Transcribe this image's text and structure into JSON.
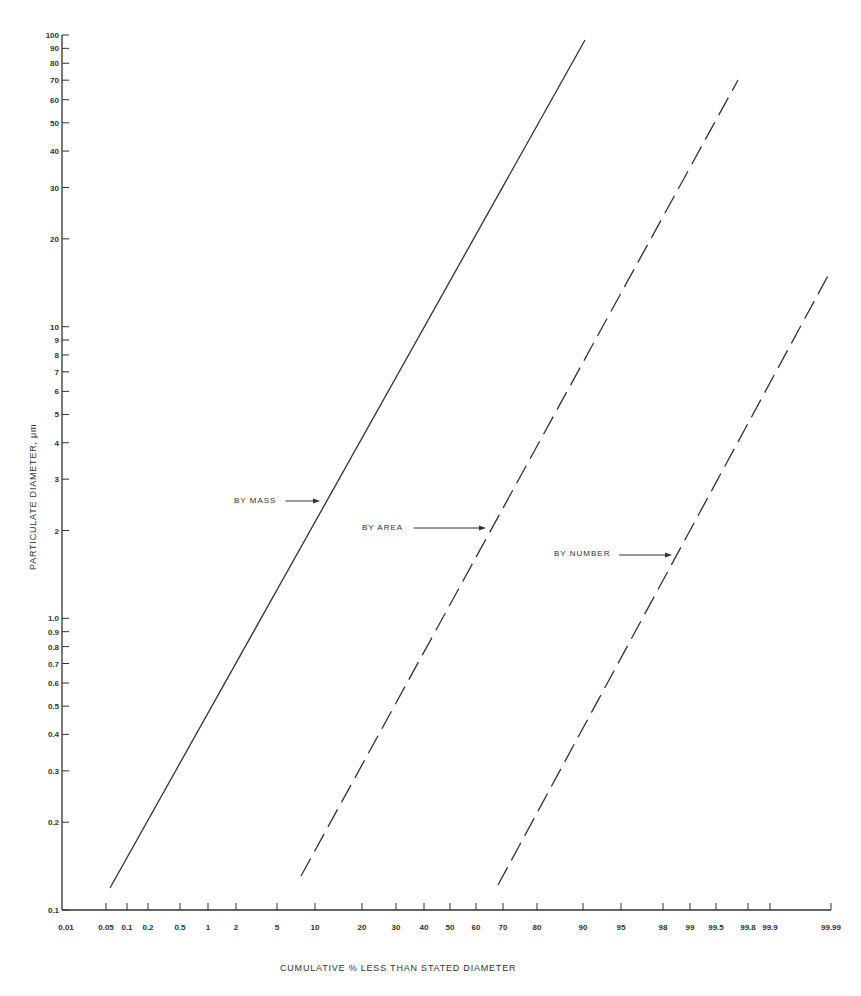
{
  "chart_data": {
    "type": "line",
    "title": "",
    "xlabel": "CUMULATIVE % LESS THAN STATED DIAMETER",
    "ylabel": "PARTICULATE DIAMETER, μm",
    "xscale": "probability",
    "yscale": "log",
    "ylim": [
      0.1,
      100
    ],
    "xlim": [
      0.01,
      99.99
    ],
    "grid": false,
    "legend_position": "inline-annotations",
    "x_ticks": [
      {
        "value": 0.01,
        "label": "0.01",
        "px": 66
      },
      {
        "value": 0.05,
        "label": "0.05",
        "px": 106
      },
      {
        "value": 0.1,
        "label": "0.1",
        "px": 127
      },
      {
        "value": 0.2,
        "label": "0.2",
        "px": 148
      },
      {
        "value": 0.5,
        "label": "0.5",
        "px": 180
      },
      {
        "value": 1,
        "label": "1",
        "px": 208
      },
      {
        "value": 2,
        "label": "2",
        "px": 236
      },
      {
        "value": 5,
        "label": "5",
        "px": 277
      },
      {
        "value": 10,
        "label": "10",
        "px": 315
      },
      {
        "value": 20,
        "label": "20",
        "px": 362
      },
      {
        "value": 30,
        "label": "30",
        "px": 396
      },
      {
        "value": 40,
        "label": "40",
        "px": 424
      },
      {
        "value": 50,
        "label": "50",
        "px": 450
      },
      {
        "value": 60,
        "label": "60",
        "px": 476
      },
      {
        "value": 70,
        "label": "70",
        "px": 503
      },
      {
        "value": 80,
        "label": "80",
        "px": 537
      },
      {
        "value": 90,
        "label": "90",
        "px": 583
      },
      {
        "value": 95,
        "label": "95",
        "px": 621
      },
      {
        "value": 98,
        "label": "98",
        "px": 663
      },
      {
        "value": 99,
        "label": "99",
        "px": 690
      },
      {
        "value": 99.5,
        "label": "99.5",
        "px": 716
      },
      {
        "value": 99.8,
        "label": "99.8",
        "px": 748
      },
      {
        "value": 99.9,
        "label": "99.9",
        "px": 770
      },
      {
        "value": 99.99,
        "label": "99.99",
        "px": 831
      }
    ],
    "y_ticks": [
      {
        "value": 100,
        "label": "100"
      },
      {
        "value": 90,
        "label": "90"
      },
      {
        "value": 80,
        "label": "80"
      },
      {
        "value": 70,
        "label": "70"
      },
      {
        "value": 60,
        "label": "60"
      },
      {
        "value": 50,
        "label": "50"
      },
      {
        "value": 40,
        "label": "40"
      },
      {
        "value": 30,
        "label": "30"
      },
      {
        "value": 20,
        "label": "20"
      },
      {
        "value": 10,
        "label": "10"
      },
      {
        "value": 9,
        "label": "9"
      },
      {
        "value": 8,
        "label": "8"
      },
      {
        "value": 7,
        "label": "7"
      },
      {
        "value": 6,
        "label": "6"
      },
      {
        "value": 5,
        "label": "5"
      },
      {
        "value": 4,
        "label": "4"
      },
      {
        "value": 3,
        "label": "3"
      },
      {
        "value": 2,
        "label": "2"
      },
      {
        "value": 1.0,
        "label": "1.0"
      },
      {
        "value": 0.9,
        "label": "0.9"
      },
      {
        "value": 0.8,
        "label": "0.8"
      },
      {
        "value": 0.7,
        "label": "0.7"
      },
      {
        "value": 0.6,
        "label": "0.6"
      },
      {
        "value": 0.5,
        "label": "0.5"
      },
      {
        "value": 0.4,
        "label": "0.4"
      },
      {
        "value": 0.3,
        "label": "0.3"
      },
      {
        "value": 0.2,
        "label": "0.2"
      },
      {
        "value": 0.1,
        "label": "0.1"
      }
    ],
    "series": [
      {
        "name": "BY MASS",
        "style": "solid",
        "points": [
          {
            "x": 0.05,
            "y": 0.12
          },
          {
            "x": 10,
            "y": 2.5
          },
          {
            "x": 50,
            "y": 14
          },
          {
            "x": 90,
            "y": 95
          }
        ],
        "label_pos": {
          "x": 234,
          "y": 503
        },
        "arrow_to": {
          "x": 320,
          "y": 501
        }
      },
      {
        "name": "BY AREA",
        "style": "dashed",
        "points": [
          {
            "x": 7,
            "y": 0.13
          },
          {
            "x": 60,
            "y": 2.0
          },
          {
            "x": 99.7,
            "y": 70
          }
        ],
        "label_pos": {
          "x": 362,
          "y": 530
        },
        "arrow_to": {
          "x": 486,
          "y": 528
        }
      },
      {
        "name": "BY NUMBER",
        "style": "dashed",
        "points": [
          {
            "x": 68,
            "y": 0.12
          },
          {
            "x": 98.5,
            "y": 1.6
          },
          {
            "x": 99.99,
            "y": 15
          }
        ],
        "label_pos": {
          "x": 554,
          "y": 556
        },
        "arrow_to": {
          "x": 672,
          "y": 555
        }
      }
    ]
  },
  "labels": {
    "xlabel": "CUMULATIVE % LESS THAN STATED DIAMETER",
    "ylabel": "PARTICULATE DIAMETER, μm",
    "mass": "BY MASS",
    "area": "BY AREA",
    "number": "BY NUMBER"
  },
  "colors": {
    "ink": "#333333",
    "background": "#ffffff"
  }
}
